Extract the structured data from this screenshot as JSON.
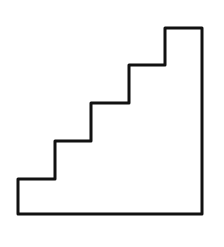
{
  "figure": {
    "stroke_color": "#111111",
    "background": "#ffffff",
    "stroke_width": 3,
    "steps": 5,
    "points": [
      [
        18,
        214
      ],
      [
        18,
        179
      ],
      [
        55,
        179
      ],
      [
        55,
        141
      ],
      [
        91,
        141
      ],
      [
        91,
        103
      ],
      [
        129,
        103
      ],
      [
        129,
        65
      ],
      [
        165,
        65
      ],
      [
        165,
        28
      ],
      [
        202,
        28
      ],
      [
        202,
        214
      ]
    ]
  }
}
